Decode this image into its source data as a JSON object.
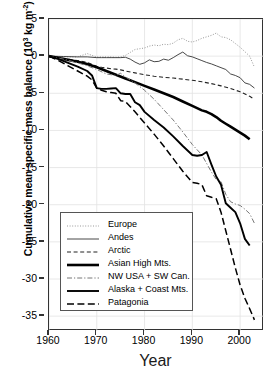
{
  "chart_data": {
    "type": "line",
    "title": "",
    "xlabel": "Year",
    "ylabel": "Cumulative mean specific mass balance (10³ kg m⁻²)",
    "ylabel_parts": {
      "main": "Cumulative mean specific mass balance (10",
      "sup1": "3",
      "mid": " kg m",
      "sup2": "-2",
      "tail": ")"
    },
    "xlim": [
      1960,
      2005
    ],
    "ylim": [
      -37,
      5
    ],
    "grid": true,
    "legend_position": "bottom-left",
    "xticks": [
      "1960",
      "1970",
      "1980",
      "1990",
      "2000"
    ],
    "xtick_values": [
      1960,
      1970,
      1980,
      1990,
      2000
    ],
    "yticks": [
      "5",
      "0",
      "-5",
      "-10",
      "-15",
      "-20",
      "-25",
      "-30",
      "-35"
    ],
    "ytick_values": [
      5,
      0,
      -5,
      -10,
      -15,
      -20,
      -25,
      -30,
      -35
    ],
    "series": [
      {
        "name": "Europe",
        "style": "dotted",
        "width": 1.0,
        "color": "#999999",
        "x": [
          1960,
          1962,
          1964,
          1966,
          1968,
          1969,
          1970,
          1971,
          1972,
          1973,
          1974,
          1975,
          1976,
          1977,
          1978,
          1979,
          1980,
          1981,
          1982,
          1983,
          1984,
          1985,
          1986,
          1987,
          1988,
          1989,
          1990,
          1991,
          1992,
          1993,
          1994,
          1995,
          1996,
          1997,
          1998,
          1999,
          2000,
          2001,
          2002,
          2003
        ],
        "values": [
          0,
          -0.05,
          -0.1,
          -0.1,
          0.35,
          0.1,
          -0.1,
          -0.1,
          -0.1,
          -0.1,
          -0.15,
          -0.1,
          0.1,
          0.5,
          0.9,
          1.0,
          1.1,
          1.35,
          1.5,
          1.4,
          1.6,
          1.55,
          1.75,
          2.2,
          2.4,
          2.0,
          1.9,
          2.1,
          2.4,
          2.6,
          2.8,
          3.1,
          2.6,
          2.5,
          2.2,
          1.7,
          1.2,
          0.6,
          0.0,
          -1.5
        ]
      },
      {
        "name": "Andes",
        "style": "solid",
        "width": 0.9,
        "color": "#333333",
        "x": [
          1960,
          1963,
          1966,
          1968,
          1969,
          1970,
          1971,
          1972,
          1973,
          1974,
          1975,
          1976,
          1977,
          1978,
          1979,
          1980,
          1981,
          1982,
          1983,
          1984,
          1985,
          1986,
          1987,
          1988,
          1989,
          1990,
          1991,
          1992,
          1993,
          1994,
          1995,
          1996,
          1997,
          1998,
          1999,
          2000,
          2001,
          2002,
          2003
        ],
        "values": [
          0,
          -0.05,
          -0.1,
          -0.1,
          -0.15,
          -0.2,
          -0.2,
          -0.2,
          -0.2,
          -0.2,
          -0.2,
          -0.15,
          -0.4,
          -0.8,
          -1.1,
          -0.9,
          -0.5,
          -0.75,
          -0.7,
          -0.4,
          -0.55,
          -0.2,
          0.2,
          0.55,
          0.05,
          -0.1,
          -0.35,
          -0.6,
          -0.85,
          -1.05,
          -1.3,
          -1.55,
          -1.8,
          -2.4,
          -2.6,
          -2.9,
          -3.6,
          -3.8,
          -4.3
        ]
      },
      {
        "name": "Arctic",
        "style": "dashed",
        "width": 1.1,
        "color": "#222222",
        "x": [
          1960,
          1963,
          1966,
          1968,
          1969,
          1970,
          1971,
          1972,
          1973,
          1974,
          1975,
          1976,
          1978,
          1980,
          1982,
          1984,
          1986,
          1988,
          1990,
          1992,
          1994,
          1996,
          1998,
          2000,
          2002,
          2003
        ],
        "values": [
          0,
          -0.3,
          -0.6,
          -0.85,
          -1.1,
          -1.35,
          -1.5,
          -1.6,
          -1.7,
          -1.75,
          -1.85,
          -2.0,
          -2.25,
          -2.5,
          -2.7,
          -2.85,
          -2.95,
          -3.1,
          -3.25,
          -3.45,
          -3.7,
          -4.0,
          -4.35,
          -4.8,
          -5.4,
          -5.8
        ]
      },
      {
        "name": "Asian High Mts.",
        "style": "solid",
        "width": 2.6,
        "color": "#000000",
        "x": [
          1960,
          1962,
          1964,
          1966,
          1968,
          1970,
          1972,
          1974,
          1976,
          1978,
          1980,
          1982,
          1984,
          1986,
          1988,
          1990,
          1992,
          1993,
          1994,
          1995,
          1996,
          1997,
          1998,
          1999,
          2000,
          2001,
          2002
        ],
        "values": [
          0,
          -0.25,
          -0.5,
          -0.75,
          -1.05,
          -1.5,
          -2.0,
          -2.5,
          -3.0,
          -3.5,
          -4.0,
          -4.5,
          -5.0,
          -5.5,
          -6.1,
          -6.7,
          -7.3,
          -7.5,
          -7.8,
          -8.2,
          -8.7,
          -9.1,
          -9.5,
          -9.9,
          -10.3,
          -10.7,
          -11.2
        ]
      },
      {
        "name": "NW USA + SW Can.",
        "style": "dashdot",
        "width": 1.0,
        "color": "#777777",
        "x": [
          1960,
          1963,
          1966,
          1968,
          1970,
          1972,
          1974,
          1975,
          1976,
          1978,
          1980,
          1982,
          1984,
          1986,
          1988,
          1990,
          1992,
          1994,
          1995,
          1996,
          1997,
          1998,
          1999,
          2000,
          2001,
          2002,
          2003
        ],
        "values": [
          0,
          -0.4,
          -0.9,
          -1.3,
          -1.8,
          -2.4,
          -2.6,
          -2.3,
          -2.8,
          -3.6,
          -4.6,
          -5.8,
          -7.2,
          -8.6,
          -10.2,
          -11.9,
          -13.3,
          -15.6,
          -16.6,
          -16.9,
          -18.6,
          -19.6,
          -19.9,
          -20.1,
          -20.6,
          -21.2,
          -22.5
        ]
      },
      {
        "name": "Alaska + Coast Mts.",
        "style": "solid",
        "width": 1.9,
        "color": "#000000",
        "x": [
          1960,
          1962,
          1964,
          1966,
          1968,
          1969,
          1970,
          1971,
          1972,
          1973,
          1974,
          1975,
          1976,
          1977,
          1978,
          1979,
          1980,
          1982,
          1984,
          1986,
          1988,
          1990,
          1991,
          1992,
          1993,
          1994,
          1995,
          1996,
          1997,
          1998,
          1999,
          2000,
          2001,
          2002
        ],
        "values": [
          0,
          -0.4,
          -0.9,
          -1.4,
          -2.0,
          -2.6,
          -4.3,
          -4.4,
          -4.4,
          -4.35,
          -4.3,
          -5.0,
          -5.1,
          -5.1,
          -6.2,
          -6.6,
          -7.5,
          -8.6,
          -9.6,
          -10.8,
          -12.1,
          -13.3,
          -13.4,
          -13.3,
          -12.9,
          -14.6,
          -16.2,
          -17.3,
          -19.8,
          -20.4,
          -21.0,
          -22.5,
          -24.6,
          -25.5
        ]
      },
      {
        "name": "Patagonia",
        "style": "longdash",
        "width": 1.5,
        "color": "#000000",
        "x": [
          1960,
          1962,
          1964,
          1966,
          1968,
          1969,
          1970,
          1971,
          1972,
          1973,
          1974,
          1975,
          1976,
          1978,
          1980,
          1982,
          1984,
          1986,
          1988,
          1990,
          1991,
          1992,
          1993,
          1994,
          1995,
          1996,
          1997,
          1998,
          1999,
          2000,
          2001,
          2002,
          2003
        ],
        "values": [
          0,
          -0.6,
          -1.3,
          -2.0,
          -2.7,
          -3.2,
          -4.3,
          -4.6,
          -4.8,
          -4.9,
          -5.0,
          -6.0,
          -6.1,
          -7.5,
          -9.0,
          -10.5,
          -12.1,
          -13.8,
          -15.5,
          -17.0,
          -17.1,
          -17.3,
          -18.8,
          -19.0,
          -19.2,
          -21.0,
          -23.5,
          -26.0,
          -28.5,
          -30.8,
          -32.6,
          -34.0,
          -35.5
        ]
      }
    ]
  },
  "legend": {
    "items": [
      {
        "label": "Europe"
      },
      {
        "label": "Andes"
      },
      {
        "label": "Arctic"
      },
      {
        "label": "Asian High Mts."
      },
      {
        "label": "NW USA + SW Can."
      },
      {
        "label": "Alaska + Coast Mts."
      },
      {
        "label": "Patagonia"
      }
    ]
  }
}
